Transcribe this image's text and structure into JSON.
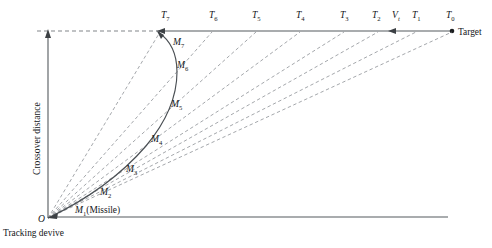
{
  "figure": {
    "background_color": "#ffffff",
    "line_color": "#555a5e",
    "dash_color": "#8d9196",
    "trajectory_color": "#4a4f54"
  },
  "axes": {
    "vertical_label": "Crossover distance",
    "origin_label": "O",
    "origin_caption": "Tracking devive"
  },
  "target": {
    "label": "Target",
    "dot_x": 452,
    "dot_y": 31
  },
  "target_positions": [
    {
      "base": "T",
      "sub": "7",
      "x": 161,
      "y": 18
    },
    {
      "base": "T",
      "sub": "6",
      "x": 209,
      "y": 18
    },
    {
      "base": "T",
      "sub": "5",
      "x": 252,
      "y": 18
    },
    {
      "base": "T",
      "sub": "4",
      "x": 296,
      "y": 18
    },
    {
      "base": "T",
      "sub": "3",
      "x": 340,
      "y": 18
    },
    {
      "base": "T",
      "sub": "2",
      "x": 372,
      "y": 18
    },
    {
      "base": "V",
      "sub": "t",
      "x": 392,
      "y": 18
    },
    {
      "base": "T",
      "sub": "1",
      "x": 412,
      "y": 18
    },
    {
      "base": "T",
      "sub": "0",
      "x": 446,
      "y": 18
    }
  ],
  "missile_positions": [
    {
      "base": "M",
      "sub": "1",
      "suffix": "(Missile)",
      "x": 75,
      "y": 213
    },
    {
      "base": "M",
      "sub": "2",
      "suffix": "",
      "x": 100,
      "y": 195
    },
    {
      "base": "M",
      "sub": "3",
      "suffix": "",
      "x": 126,
      "y": 172
    },
    {
      "base": "M",
      "sub": "4",
      "suffix": "",
      "x": 151,
      "y": 142
    },
    {
      "base": "M",
      "sub": "5",
      "suffix": "",
      "x": 171,
      "y": 107
    },
    {
      "base": "M",
      "sub": "6",
      "suffix": "",
      "x": 177,
      "y": 68
    },
    {
      "base": "M",
      "sub": "7",
      "suffix": "",
      "x": 173,
      "y": 45
    }
  ],
  "geometry": {
    "origin_x": 48,
    "origin_y": 218,
    "top_axis_y": 31,
    "top_axis_left_x": 155,
    "top_axis_right_x": 452,
    "bottom_axis_y": 217,
    "bottom_axis_right_x": 448,
    "dashed_left_x": 37,
    "sight_line_endpoints_x": [
      160,
      212,
      256,
      300,
      344,
      378,
      416,
      452
    ],
    "trajectory_points": "48,218 95,196 133,160 160,118 173,76 167,42 158,32"
  }
}
